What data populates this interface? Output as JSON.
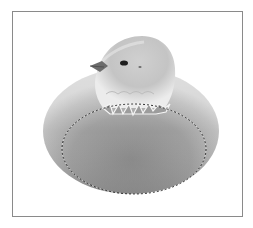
{
  "image": {
    "description": "A fluffy chick emerging from the top of a smooth egg, with a dashed elliptical marquee selection drawn around the lower portion of the egg",
    "subjects": [
      "chick",
      "egg",
      "elliptical-selection-marquee"
    ],
    "colors": {
      "frame_border": "#8a8a8a",
      "background": "#ffffff",
      "egg_light": "#d6d6d6",
      "egg_dark": "#7c7c7c",
      "chick_light": "#efefef",
      "chick_dark": "#9a9a9a",
      "selection_line": "#3a3a3a"
    }
  }
}
